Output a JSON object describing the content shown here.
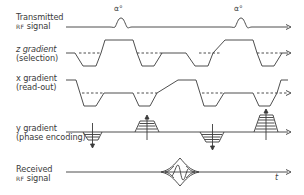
{
  "rows": [
    {
      "line1": "Transmitted",
      "line2_small": "RF",
      "line2": " signal"
    },
    {
      "line1": "z gradient",
      "line2": "(selection)"
    },
    {
      "line1": "x gradient",
      "line2": "(read-out)"
    },
    {
      "line1": "y gradient",
      "line2": "(phase encoding)"
    },
    {
      "line1": "Received",
      "line2_small": "RF",
      "line2": " signal"
    }
  ],
  "pulse_labels": [
    "α°",
    "α°"
  ],
  "time_axis_label": "t",
  "colors": {
    "line": "#3a3a3a",
    "background": "#ffffff"
  }
}
